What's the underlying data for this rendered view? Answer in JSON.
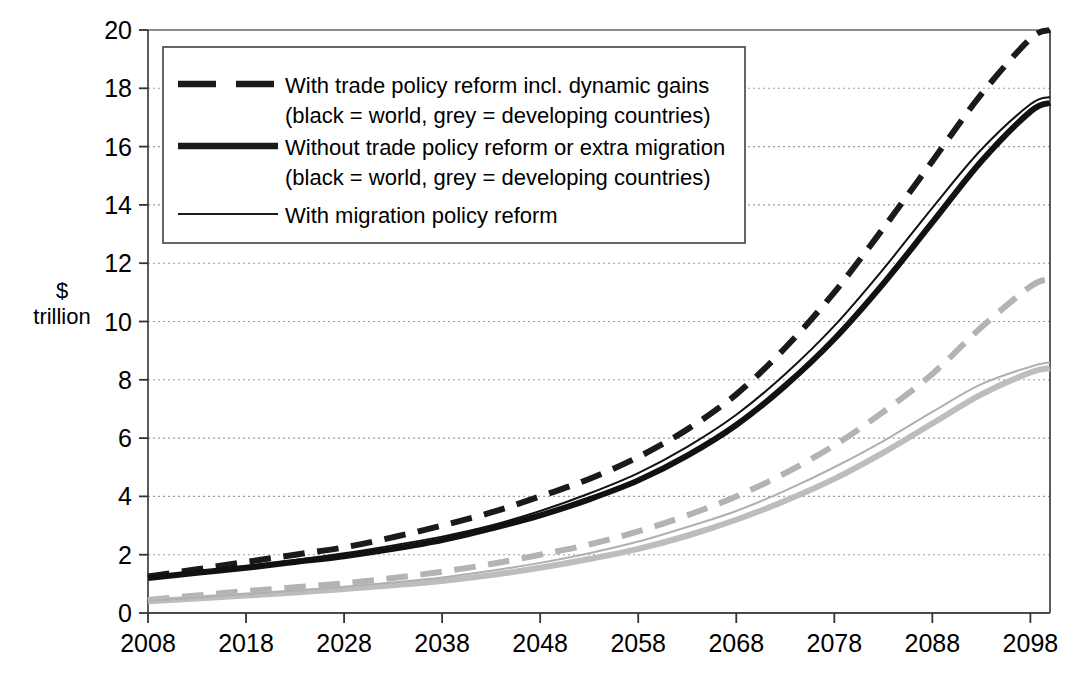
{
  "chart_data": {
    "type": "line",
    "title": "",
    "subtitle": "",
    "xlabel": "",
    "ylabel": "$ trillion",
    "ylabel_lines": [
      "$",
      "trillion"
    ],
    "xlim": [
      2008,
      2100
    ],
    "ylim": [
      0,
      20
    ],
    "x_ticks": [
      "2008",
      "2018",
      "2028",
      "2038",
      "2048",
      "2058",
      "2068",
      "2078",
      "2088",
      "2098"
    ],
    "x_tick_values": [
      2008,
      2018,
      2028,
      2038,
      2048,
      2058,
      2068,
      2078,
      2088,
      2098
    ],
    "y_ticks": [
      "0",
      "2",
      "4",
      "6",
      "8",
      "10",
      "12",
      "14",
      "16",
      "18",
      "20"
    ],
    "y_tick_values": [
      0,
      2,
      4,
      6,
      8,
      10,
      12,
      14,
      16,
      18,
      20
    ],
    "grid": "horizontal-dotted",
    "legend_position": "top-left-inside",
    "x": [
      2008,
      2013,
      2018,
      2023,
      2028,
      2033,
      2038,
      2043,
      2048,
      2053,
      2058,
      2063,
      2068,
      2073,
      2078,
      2083,
      2088,
      2093,
      2098,
      2100
    ],
    "series": [
      {
        "name": "With trade policy reform incl. dynamic gains (world)",
        "color": "#1a1a1a",
        "style": "dashed",
        "width": 6,
        "group": "world",
        "values": [
          1.25,
          1.5,
          1.75,
          2.0,
          2.25,
          2.6,
          3.0,
          3.45,
          4.0,
          4.6,
          5.35,
          6.3,
          7.5,
          9.1,
          11.0,
          13.2,
          15.5,
          17.8,
          19.7,
          20.0
        ]
      },
      {
        "name": "Without trade policy reform or extra migration (world)",
        "color": "#111111",
        "style": "solid",
        "width": 6,
        "group": "world",
        "values": [
          1.2,
          1.38,
          1.55,
          1.75,
          1.95,
          2.2,
          2.5,
          2.9,
          3.35,
          3.9,
          4.55,
          5.4,
          6.45,
          7.8,
          9.4,
          11.3,
          13.4,
          15.5,
          17.2,
          17.5
        ]
      },
      {
        "name": "With migration policy reform (world)",
        "color": "#111111",
        "style": "solid",
        "width": 2,
        "group": "world",
        "values": [
          1.22,
          1.42,
          1.6,
          1.82,
          2.05,
          2.32,
          2.62,
          3.0,
          3.5,
          4.1,
          4.8,
          5.7,
          6.8,
          8.2,
          9.85,
          11.8,
          13.9,
          15.9,
          17.45,
          17.7
        ]
      },
      {
        "name": "With trade policy reform incl. dynamic gains (developing countries)",
        "color": "#b3b3b3",
        "style": "dashed",
        "width": 6,
        "group": "developing",
        "values": [
          0.45,
          0.6,
          0.75,
          0.88,
          1.02,
          1.2,
          1.42,
          1.68,
          2.0,
          2.35,
          2.8,
          3.35,
          4.0,
          4.8,
          5.75,
          6.9,
          8.2,
          9.8,
          11.2,
          11.45
        ]
      },
      {
        "name": "Without trade policy reform or extra migration (developing countries)",
        "color": "#bdbdbd",
        "style": "solid",
        "width": 6,
        "group": "developing",
        "values": [
          0.4,
          0.5,
          0.6,
          0.7,
          0.82,
          0.95,
          1.1,
          1.3,
          1.55,
          1.85,
          2.2,
          2.65,
          3.2,
          3.85,
          4.6,
          5.5,
          6.5,
          7.5,
          8.25,
          8.4
        ]
      },
      {
        "name": "With migration policy reform (developing countries)",
        "color": "#b0b0b0",
        "style": "solid",
        "width": 2,
        "group": "developing",
        "values": [
          0.42,
          0.53,
          0.65,
          0.76,
          0.9,
          1.05,
          1.22,
          1.45,
          1.72,
          2.05,
          2.45,
          2.95,
          3.5,
          4.2,
          5.0,
          5.9,
          6.9,
          7.85,
          8.45,
          8.6
        ]
      }
    ],
    "legend": [
      {
        "id": "legend-entry-trade-reform",
        "sample": "dashed-thick-black",
        "lines": [
          "With trade policy reform incl. dynamic gains",
          "(black = world, grey = developing countries)"
        ]
      },
      {
        "id": "legend-entry-no-reform",
        "sample": "solid-thick-black",
        "lines": [
          "Without trade policy reform or extra migration",
          "(black = world, grey = developing countries)"
        ]
      },
      {
        "id": "legend-entry-migration-reform",
        "sample": "solid-thin-black",
        "lines": [
          "With migration policy reform"
        ]
      }
    ],
    "colors": {
      "black": "#111111",
      "grey": "#b8b8b8",
      "axis": "#555555",
      "grid": "#9a9a9a",
      "background": "#ffffff"
    }
  }
}
